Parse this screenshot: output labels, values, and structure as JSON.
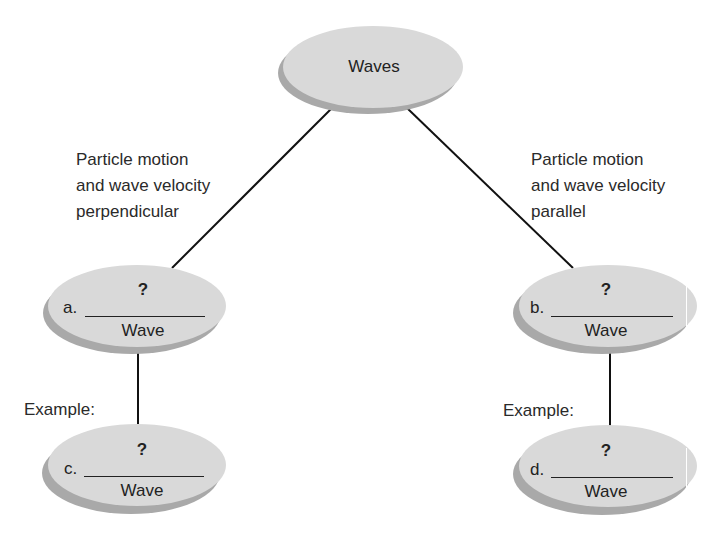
{
  "diagram": {
    "root": {
      "label": "Waves"
    },
    "branches": [
      {
        "edge_label": [
          "Particle motion",
          "and wave velocity",
          "perpendicular"
        ],
        "type_node": {
          "letter": "a.",
          "blank": "?",
          "suffix": "Wave"
        },
        "example_label": "Example:",
        "example_node": {
          "letter": "c.",
          "blank": "?",
          "suffix": "Wave"
        }
      },
      {
        "edge_label": [
          "Particle motion",
          "and wave velocity",
          "parallel"
        ],
        "type_node": {
          "letter": "b.",
          "blank": "?",
          "suffix": "Wave"
        },
        "example_label": "Example:",
        "example_node": {
          "letter": "d.",
          "blank": "?",
          "suffix": "Wave"
        }
      }
    ],
    "colors": {
      "node_fill": "#d9d9d9",
      "node_shadow": "#a9a9a9",
      "line": "#111111",
      "text": "#222222"
    }
  }
}
